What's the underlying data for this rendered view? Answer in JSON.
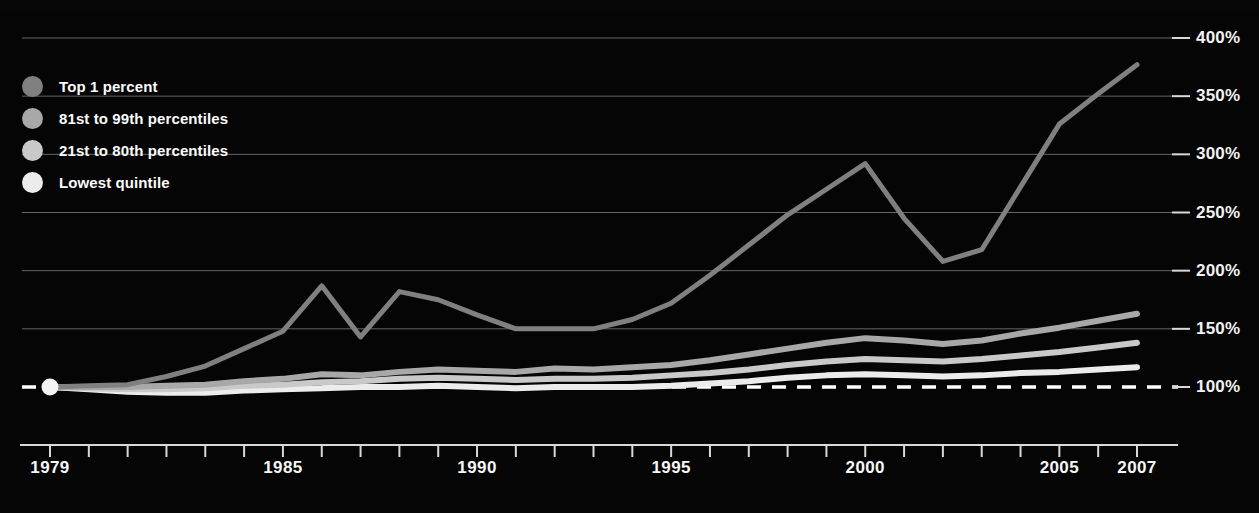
{
  "chart_data": {
    "type": "line",
    "title": "",
    "subtitle": "",
    "xlabel": "",
    "ylabel": "",
    "x": [
      1979,
      1980,
      1981,
      1982,
      1983,
      1984,
      1985,
      1986,
      1987,
      1988,
      1989,
      1990,
      1991,
      1992,
      1993,
      1994,
      1995,
      1996,
      1997,
      1998,
      1999,
      2000,
      2001,
      2002,
      2003,
      2004,
      2005,
      2006,
      2007
    ],
    "xlim": [
      1979,
      2007
    ],
    "ylim": [
      90,
      400
    ],
    "yticks": [
      100,
      150,
      200,
      250,
      300,
      350,
      400
    ],
    "ytick_labels": [
      "100%",
      "150%",
      "200%",
      "250%",
      "300%",
      "350%",
      "400%"
    ],
    "xtick_labels": [
      "1979",
      "1985",
      "1990",
      "1995",
      "2000",
      "2005",
      "2007"
    ],
    "xtick_values": [
      1979,
      1985,
      1990,
      1995,
      2000,
      2005,
      2007
    ],
    "grid": "horizontal",
    "baseline": 100,
    "baseline_style": "dashed",
    "legend_position": "upper-left",
    "background": "#050505",
    "series": [
      {
        "name": "Top 1 percent",
        "color": "#808080",
        "values": [
          100,
          101,
          102,
          109,
          118,
          133,
          148,
          187,
          143,
          182,
          175,
          162,
          150,
          150,
          150,
          158,
          172,
          196,
          222,
          248,
          270,
          292,
          245,
          208,
          218,
          272,
          326,
          352,
          377
        ]
      },
      {
        "name": "81st to 99th percentiles",
        "color": "#a8a8a8",
        "values": [
          100,
          100,
          100,
          101,
          102,
          105,
          107,
          111,
          110,
          113,
          115,
          114,
          113,
          116,
          115,
          117,
          119,
          123,
          128,
          133,
          138,
          142,
          140,
          137,
          140,
          146,
          151,
          157,
          163
        ]
      },
      {
        "name": "21st to 80th percentiles",
        "color": "#c9c9c9",
        "values": [
          100,
          99,
          98,
          98,
          99,
          101,
          102,
          104,
          105,
          107,
          108,
          107,
          106,
          107,
          107,
          108,
          110,
          112,
          115,
          119,
          122,
          124,
          123,
          122,
          124,
          127,
          130,
          134,
          138
        ]
      },
      {
        "name": "Lowest quintile",
        "color": "#ececec",
        "values": [
          100,
          98,
          96,
          95,
          95,
          97,
          98,
          99,
          100,
          100,
          101,
          100,
          99,
          100,
          100,
          100,
          101,
          103,
          105,
          108,
          110,
          111,
          110,
          109,
          110,
          112,
          113,
          115,
          117
        ]
      }
    ]
  },
  "legend": {
    "items": [
      {
        "label": "Top 1 percent",
        "color": "#808080"
      },
      {
        "label": "81st to 99th percentiles",
        "color": "#a8a8a8"
      },
      {
        "label": "21st to 80th percentiles",
        "color": "#c9c9c9"
      },
      {
        "label": "Lowest quintile",
        "color": "#ececec"
      }
    ]
  },
  "axis": {
    "y_labels": [
      "400%",
      "350%",
      "300%",
      "250%",
      "200%",
      "150%",
      "100%"
    ],
    "x_labels": [
      "1979",
      "1985",
      "1990",
      "1995",
      "2000",
      "2005",
      "2007"
    ]
  },
  "style": {
    "background": "#050505",
    "grid_color": "#8c8c8c",
    "axis_color": "#d8d8d8",
    "text_color": "#f5f5f5"
  }
}
